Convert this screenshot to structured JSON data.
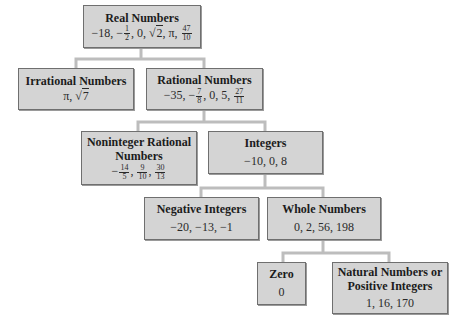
{
  "diagram": {
    "type": "tree",
    "line_color": "#bdbdbd",
    "box_fill": "#d4d4d4",
    "nodes": {
      "real": {
        "title": "Real Numbers",
        "values": [
          "−18",
          "−1/2",
          "0",
          "√2",
          "π",
          "47/10"
        ],
        "v0": "−18, −",
        "f1n": "1",
        "f1d": "2",
        "v1": ", 0, ",
        "sq": "√",
        "sqv": "2",
        "v2": ", π, ",
        "f2n": "47",
        "f2d": "10"
      },
      "irrational": {
        "title": "Irrational Numbers",
        "values": [
          "π",
          "√7"
        ],
        "v0": "π, ",
        "sq": "√",
        "sqv": "7"
      },
      "rational": {
        "title": "Rational Numbers",
        "values": [
          "−35",
          "−7/8",
          "0",
          "5",
          "27/11"
        ],
        "v0": "−35, −",
        "f1n": "7",
        "f1d": "8",
        "v1": ", 0, 5, ",
        "f2n": "27",
        "f2d": "11"
      },
      "noninteger": {
        "title_line1": "Noninteger Rational",
        "title_line2": "Numbers",
        "values": [
          "−14/5",
          "9/10",
          "30/13"
        ],
        "v0": "−",
        "f1n": "14",
        "f1d": "5",
        "sep1": ", ",
        "f2n": "9",
        "f2d": "10",
        "sep2": ", ",
        "f3n": "30",
        "f3d": "13"
      },
      "integers": {
        "title": "Integers",
        "values_text": "−10, 0, 8"
      },
      "negative": {
        "title": "Negative Integers",
        "values_text": "−20, −13, −1"
      },
      "whole": {
        "title": "Whole Numbers",
        "values_text": "0, 2, 56, 198"
      },
      "zero": {
        "title": "Zero",
        "values_text": "0"
      },
      "natural": {
        "title_line1": "Natural Numbers or",
        "title_line2": "Positive Integers",
        "values_text": "1, 16, 170"
      }
    },
    "edges": [
      [
        "Real Numbers",
        "Irrational Numbers"
      ],
      [
        "Real Numbers",
        "Rational Numbers"
      ],
      [
        "Rational Numbers",
        "Noninteger Rational Numbers"
      ],
      [
        "Rational Numbers",
        "Integers"
      ],
      [
        "Integers",
        "Negative Integers"
      ],
      [
        "Integers",
        "Whole Numbers"
      ],
      [
        "Whole Numbers",
        "Zero"
      ],
      [
        "Whole Numbers",
        "Natural Numbers or Positive Integers"
      ]
    ]
  }
}
